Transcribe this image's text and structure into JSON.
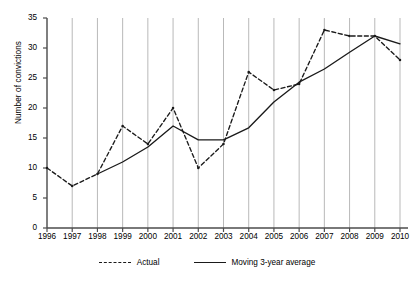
{
  "chart_data": {
    "type": "line",
    "title": "",
    "xlabel": "",
    "ylabel": "Number of convictions",
    "categories": [
      "1996",
      "1997",
      "1998",
      "1999",
      "2000",
      "2001",
      "2002",
      "2003",
      "2004",
      "2005",
      "2006",
      "2007",
      "2008",
      "2009",
      "2010"
    ],
    "x": [
      1996,
      1997,
      1998,
      1999,
      2000,
      2001,
      2002,
      2003,
      2004,
      2005,
      2006,
      2007,
      2008,
      2009,
      2010
    ],
    "ylim": [
      0,
      35
    ],
    "yticks": [
      0,
      5,
      10,
      15,
      20,
      25,
      30,
      35
    ],
    "grid": "vertical-only",
    "legend_position": "bottom-center",
    "series": [
      {
        "name": "Actual",
        "style": "dashed",
        "color": "#1a1a1a",
        "markers": true,
        "values": [
          10,
          7,
          9,
          17,
          14,
          20,
          10,
          14,
          26,
          23,
          24,
          33,
          32,
          32,
          28
        ]
      },
      {
        "name": "Moving 3-year average",
        "style": "solid",
        "color": "#1a1a1a",
        "markers": false,
        "values": [
          null,
          null,
          9,
          11,
          13.5,
          17,
          14.7,
          14.7,
          16.7,
          21,
          24.3,
          26.5,
          29.3,
          32,
          30.7
        ]
      }
    ]
  },
  "axis": {
    "y_label": "Number of convictions",
    "y_tick_labels": [
      "0",
      "5",
      "10",
      "15",
      "20",
      "25",
      "30",
      "35"
    ],
    "x_tick_labels": [
      "1996",
      "1997",
      "1998",
      "1999",
      "2000",
      "2001",
      "2002",
      "2003",
      "2004",
      "2005",
      "2006",
      "2007",
      "2008",
      "2009",
      "2010"
    ]
  },
  "legend": {
    "items": [
      {
        "label": "Actual",
        "style": "dashed"
      },
      {
        "label": "Moving 3-year average",
        "style": "solid"
      }
    ]
  }
}
